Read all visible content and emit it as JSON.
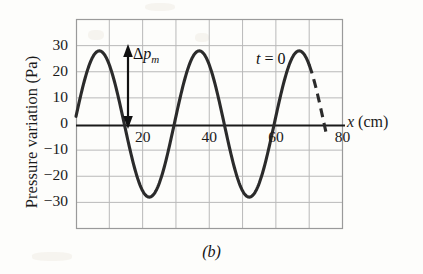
{
  "figure": {
    "caption": "(b)",
    "background_color": "#fdfdfb",
    "curve_color": "#2b2b2b",
    "grid_color": "#b9b9b9",
    "axis_color": "#1a1a1a"
  },
  "annotations": {
    "amplitude_label_delta": "Δ",
    "amplitude_label_p": "p",
    "amplitude_label_sub": "m",
    "time_label": "t = 0",
    "time_label_var": "t",
    "time_label_rest": " = 0"
  },
  "chart_data": {
    "type": "line",
    "title": "",
    "subtitle": "",
    "xlabel": "x (cm)",
    "xlabel_var": "x",
    "xlabel_unit": "(cm)",
    "ylabel": "Pressure variation (Pa)",
    "xlim": [
      0,
      80
    ],
    "ylim": [
      -40,
      40
    ],
    "xticks": [
      20,
      40,
      60,
      80
    ],
    "xtick_labels": [
      "20",
      "40",
      "60",
      "80"
    ],
    "yticks": [
      30,
      20,
      10,
      0,
      -10,
      -20,
      -30
    ],
    "ytick_labels": [
      "30",
      "20",
      "10",
      "0",
      "−10",
      "−20",
      "−30"
    ],
    "grid": true,
    "grid_x_step": 10,
    "grid_y_step": 10,
    "legend": "none",
    "series": [
      {
        "name": "pressure variation",
        "style": "solid",
        "amplitude": 28,
        "wavelength": 30,
        "phase_deg": 6,
        "x_start": 0,
        "x_end": 70,
        "comment": "sinusoid of amplitude 28 Pa, wavelength 30 cm"
      },
      {
        "name": "pressure variation continuation",
        "style": "dashed",
        "amplitude": 28,
        "wavelength": 30,
        "phase_deg": 6,
        "x_start": 70,
        "x_end": 75,
        "comment": "dashed continuation beyond plotted range"
      }
    ],
    "annotations": [
      {
        "name": "amplitude-arrow",
        "text": "Δp_m",
        "x": 14,
        "y_from": 0,
        "y_to": 28
      },
      {
        "name": "time-label",
        "text": "t = 0",
        "x": 54,
        "y": 22
      }
    ]
  }
}
